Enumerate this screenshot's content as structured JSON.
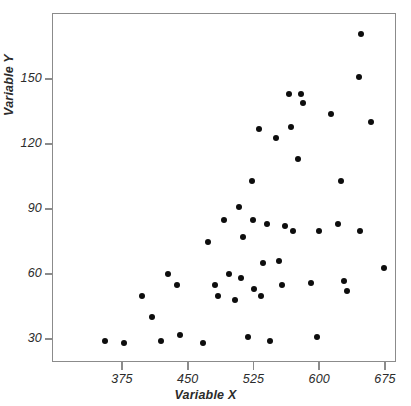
{
  "chart_data": {
    "type": "scatter",
    "title": "",
    "xlabel": "Variable X",
    "ylabel": "Variable Y",
    "xlim": [
      352,
      683
    ],
    "ylim": [
      17,
      174
    ],
    "xticks": [
      375,
      450,
      525,
      600,
      675
    ],
    "xtick_labels": [
      "375",
      "450",
      "525",
      "600",
      "675"
    ],
    "yticks": [
      30,
      60,
      90,
      120,
      150
    ],
    "ytick_labels": [
      "30",
      "60",
      "90",
      "120",
      "150"
    ],
    "grid": false,
    "legend": false,
    "marker": {
      "shape": "circle",
      "color": "#0d0d0d",
      "size": 6
    },
    "frame_color": "#8b8b8b",
    "background": "#ffffff",
    "points": [
      {
        "x": 356,
        "y": 29
      },
      {
        "x": 377,
        "y": 28
      },
      {
        "x": 398,
        "y": 50
      },
      {
        "x": 409,
        "y": 40
      },
      {
        "x": 420,
        "y": 29
      },
      {
        "x": 428,
        "y": 60
      },
      {
        "x": 438,
        "y": 55
      },
      {
        "x": 441,
        "y": 32
      },
      {
        "x": 467,
        "y": 28
      },
      {
        "x": 473,
        "y": 75
      },
      {
        "x": 481,
        "y": 55
      },
      {
        "x": 485,
        "y": 50
      },
      {
        "x": 491,
        "y": 85
      },
      {
        "x": 497,
        "y": 60
      },
      {
        "x": 504,
        "y": 48
      },
      {
        "x": 509,
        "y": 91
      },
      {
        "x": 511,
        "y": 58
      },
      {
        "x": 513,
        "y": 77
      },
      {
        "x": 519,
        "y": 31
      },
      {
        "x": 523,
        "y": 103
      },
      {
        "x": 524,
        "y": 85
      },
      {
        "x": 526,
        "y": 53
      },
      {
        "x": 531,
        "y": 127
      },
      {
        "x": 533,
        "y": 50
      },
      {
        "x": 536,
        "y": 65
      },
      {
        "x": 540,
        "y": 83
      },
      {
        "x": 544,
        "y": 29
      },
      {
        "x": 551,
        "y": 123
      },
      {
        "x": 554,
        "y": 66
      },
      {
        "x": 558,
        "y": 55
      },
      {
        "x": 561,
        "y": 82
      },
      {
        "x": 566,
        "y": 143
      },
      {
        "x": 568,
        "y": 128
      },
      {
        "x": 570,
        "y": 80
      },
      {
        "x": 576,
        "y": 113
      },
      {
        "x": 579,
        "y": 143
      },
      {
        "x": 582,
        "y": 139
      },
      {
        "x": 591,
        "y": 56
      },
      {
        "x": 597,
        "y": 31
      },
      {
        "x": 600,
        "y": 80
      },
      {
        "x": 613,
        "y": 134
      },
      {
        "x": 621,
        "y": 83
      },
      {
        "x": 625,
        "y": 103
      },
      {
        "x": 628,
        "y": 57
      },
      {
        "x": 632,
        "y": 52
      },
      {
        "x": 645,
        "y": 151
      },
      {
        "x": 646,
        "y": 80
      },
      {
        "x": 648,
        "y": 171
      },
      {
        "x": 659,
        "y": 130
      },
      {
        "x": 674,
        "y": 63
      }
    ]
  }
}
